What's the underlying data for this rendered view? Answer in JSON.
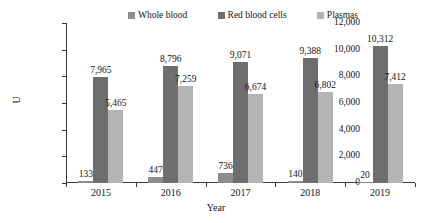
{
  "chart_data": {
    "type": "bar",
    "title": "",
    "subtitle": "",
    "xlabel": "Year",
    "ylabel": "U",
    "categories": [
      "2015",
      "2016",
      "2017",
      "2018",
      "2019"
    ],
    "series": [
      {
        "name": "Whole blood",
        "color": "#8d8d8d",
        "values": [
          133,
          447,
          736,
          140,
          20
        ],
        "labels": [
          "133",
          "447",
          "736",
          "140",
          "20"
        ]
      },
      {
        "name": "Red blood cells",
        "color": "#6e6e6e",
        "values": [
          7965,
          8796,
          9071,
          9388,
          10312
        ],
        "labels": [
          "7,965",
          "8,796",
          "9,071",
          "9,388",
          "10,312"
        ]
      },
      {
        "name": "Plasmas",
        "color": "#b4b4b4",
        "values": [
          5465,
          7259,
          6674,
          6802,
          7412
        ],
        "labels": [
          "5,465",
          "7,259",
          "6,674",
          "6,802",
          "7,412"
        ]
      }
    ],
    "ylim": [
      0,
      12000
    ],
    "ytick_labels": [
      "12,000",
      "10,000",
      "8,000",
      "6,000",
      "4,000",
      "2,000",
      "0"
    ],
    "ytick_values": [
      12000,
      10000,
      8000,
      6000,
      4000,
      2000,
      0
    ],
    "grid": false,
    "legend_position": "top"
  },
  "legend": {
    "items": [
      {
        "label": "Whole blood",
        "color": "#8d8d8d"
      },
      {
        "label": "Red blood cells",
        "color": "#6e6e6e"
      },
      {
        "label": "Plasmas",
        "color": "#b4b4b4"
      }
    ]
  }
}
